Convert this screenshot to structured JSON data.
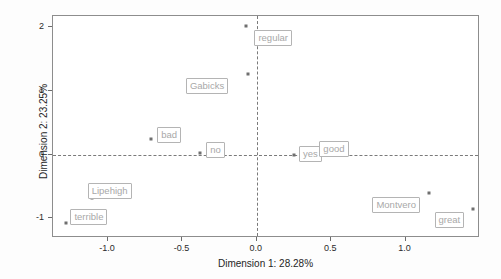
{
  "chart_data": {
    "type": "scatter",
    "title": "",
    "xlabel": "Dimension 1: 28.28%",
    "ylabel": "Dimension 2: 23.25%",
    "xlim": [
      -1.37,
      1.5
    ],
    "ylim": [
      -1.31,
      2.18
    ],
    "xticks": [
      -1.0,
      -0.5,
      0.0,
      0.5,
      1.0
    ],
    "xticklabels": [
      "-1.0",
      "-0.5",
      "0.0",
      "0.5",
      "1.0"
    ],
    "yticks": [
      2,
      1,
      0,
      -1
    ],
    "yticklabels": [
      "2",
      "1",
      "0",
      "-1"
    ],
    "grid": false,
    "legend": null,
    "reference_lines": {
      "vertical_at_x": 0.0,
      "horizontal_at_y": 0.0,
      "style": "dashed",
      "color": "#7a7a7a"
    },
    "point_color": "#6f6f6f",
    "label_box_border_color": "#b4b4b4",
    "label_text_color": "#a8a8a8",
    "points": [
      {
        "label": "regular",
        "x": -0.07,
        "y": 2.02,
        "label_dx": 8,
        "label_dy": 4
      },
      {
        "label": "Gabicks",
        "x": -0.06,
        "y": 1.27,
        "label_dx": -62,
        "label_dy": 4
      },
      {
        "label": "bad",
        "x": -0.71,
        "y": 0.25,
        "label_dx": 6,
        "label_dy": -12
      },
      {
        "label": "no",
        "x": -0.38,
        "y": 0.02,
        "label_dx": 6,
        "label_dy": -11
      },
      {
        "label": "yes",
        "x": 0.25,
        "y": -0.01,
        "label_dx": 5,
        "label_dy": -9
      },
      {
        "label": "good",
        "x": 0.38,
        "y": 0.0,
        "label_dx": 6,
        "label_dy": -14
      },
      {
        "label": "Lipehigh",
        "x": -1.11,
        "y": -0.68,
        "label_dx": -4,
        "label_dy": -15
      },
      {
        "label": "terrible",
        "x": -1.28,
        "y": -1.08,
        "label_dx": 4,
        "label_dy": -14
      },
      {
        "label": "Montvero",
        "x": 1.16,
        "y": -0.6,
        "label_dx": -57,
        "label_dy": 4
      },
      {
        "label": "great",
        "x": 1.45,
        "y": -0.85,
        "label_dx": -38,
        "label_dy": 3
      }
    ]
  }
}
